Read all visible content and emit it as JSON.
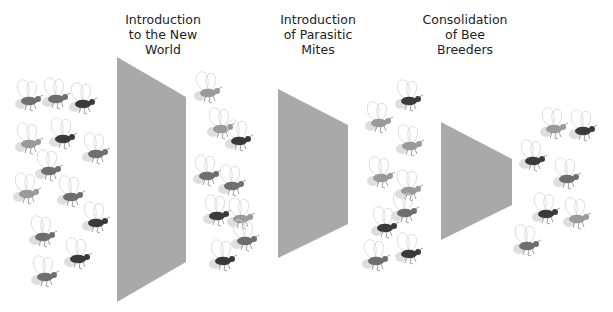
{
  "diagram": {
    "title_partial": "",
    "stages": [
      {
        "id": "stage-1",
        "label": "Introduction\nto the New\nWorld"
      },
      {
        "id": "stage-2",
        "label": "Introduction\nof Parasitic\nMites"
      },
      {
        "id": "stage-3",
        "label": "Consolidation\nof Bee\nBreeders"
      }
    ],
    "bee_groups": [
      {
        "id": "group-initial",
        "description": "Initial diverse honey bee population",
        "count": 13,
        "shades": [
          "medium",
          "medium",
          "dark",
          "light",
          "dark",
          "medium",
          "medium",
          "light",
          "medium",
          "dark",
          "medium",
          "dark",
          "medium"
        ]
      },
      {
        "id": "group-after-new-world",
        "description": "Population after introduction to the New World",
        "count": 9,
        "shades": [
          "light",
          "light",
          "dark",
          "medium",
          "medium",
          "dark",
          "light",
          "dark",
          "medium"
        ]
      },
      {
        "id": "group-after-mites",
        "description": "Population after introduction of parasitic mites",
        "count": 9,
        "shades": [
          "light",
          "dark",
          "light",
          "light",
          "light",
          "dark",
          "dark",
          "medium",
          "medium"
        ]
      },
      {
        "id": "group-after-consolidation",
        "description": "Population after consolidation of bee breeders",
        "count": 7,
        "shades": [
          "light",
          "dark",
          "dark",
          "medium",
          "dark",
          "light",
          "medium"
        ]
      }
    ],
    "colors": {
      "funnel": "#a9a9a9",
      "text": "#222222",
      "bee_light": "#9a9a9a",
      "bee_medium": "#6e6e6e",
      "bee_dark": "#3a3a3a",
      "wing": "#d8d8d8"
    }
  }
}
